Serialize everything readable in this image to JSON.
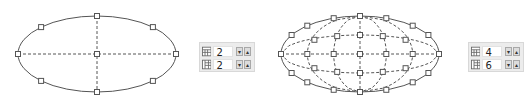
{
  "panels": [
    {
      "name": "left",
      "rows": 2,
      "cols": 2,
      "row_value": "2",
      "col_value": "2"
    },
    {
      "name": "right",
      "rows": 4,
      "cols": 6,
      "row_value": "4",
      "col_value": "6"
    }
  ],
  "icons": {
    "rows_icon": "grid-rows-icon",
    "cols_icon": "grid-columns-icon",
    "down": "▾",
    "up": "▴"
  },
  "colors": {
    "outline": "#555555",
    "handle_fill": "#ffffff",
    "panel_bg": "#ececec"
  }
}
